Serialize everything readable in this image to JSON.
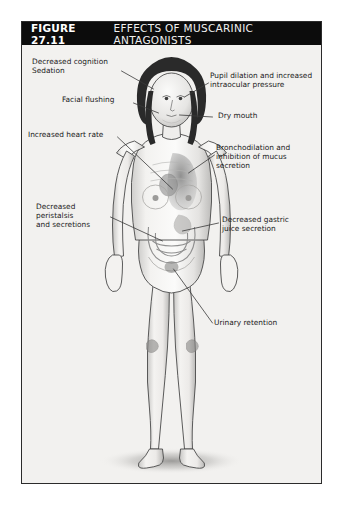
{
  "figure": {
    "number_label": "FIGURE 27.11",
    "title": "EFFECTS OF MUSCARINIC ANTAGONISTS",
    "title_bar_bg": "#0c0c0c",
    "title_text_color": "#ffffff",
    "card_bg": "#f2f1ef",
    "card_border_color": "#2b2b2b",
    "page_bg": "#ffffff"
  },
  "illustration": {
    "subject": "anterior view of female human body, grayscale medical illustration",
    "skin_color": "#efeeec",
    "shadow_color": "#b9b8b6",
    "hair_color": "#2a2a2a",
    "organ_shade": "#9a9a9a",
    "leader_line_color": "#3a3a3a"
  },
  "callouts": [
    {
      "id": "cognition-sedation",
      "side": "left",
      "text": "Decreased cognition\nSedation",
      "target": "brain / head"
    },
    {
      "id": "facial-flushing",
      "side": "left",
      "text": "Facial flushing",
      "target": "face"
    },
    {
      "id": "increased-heart-rate",
      "side": "left",
      "text": "Increased heart rate",
      "target": "heart"
    },
    {
      "id": "decreased-peristalsis",
      "side": "left",
      "text": "Decreased\nperistalsis\nand secretions",
      "target": "intestines"
    },
    {
      "id": "pupil-dilation",
      "side": "right",
      "text": "Pupil dilation and increased\nintraocular pressure",
      "target": "eye"
    },
    {
      "id": "dry-mouth",
      "side": "right",
      "text": "Dry mouth",
      "target": "mouth / salivary glands"
    },
    {
      "id": "bronchodilation",
      "side": "right",
      "text": "Bronchodilation and\ninhibition of mucus\nsecretion",
      "target": "lungs / bronchi"
    },
    {
      "id": "decreased-gastric-juice",
      "side": "right",
      "text": "Decreased gastric\njuice secretion",
      "target": "stomach"
    },
    {
      "id": "urinary-retention",
      "side": "right",
      "text": "Urinary retention",
      "target": "bladder"
    }
  ]
}
